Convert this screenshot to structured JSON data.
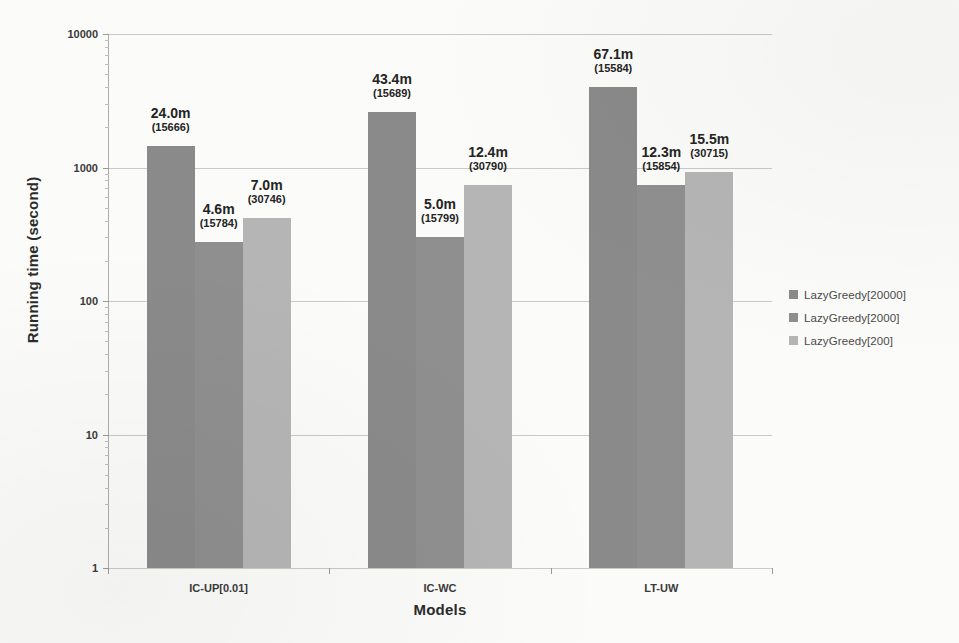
{
  "scan": {
    "clipped_top_text": "(cut off at top edge)"
  },
  "chart_data": {
    "type": "bar",
    "title": "",
    "xlabel": "Models",
    "ylabel": "Running time (second)",
    "yscale": "log",
    "ylim": [
      1,
      10000
    ],
    "ytick_labels": [
      "1",
      "10",
      "100",
      "1000",
      "10000"
    ],
    "ytick_values": [
      1,
      10,
      100,
      1000,
      10000
    ],
    "grid": true,
    "legend_position": "right",
    "categories": [
      "IC-UP[0.01]",
      "IC-WC",
      "LT-UW"
    ],
    "series": [
      {
        "name": "LazyGreedy[20000]",
        "color": "#8a8a8a",
        "values": [
          1440,
          2604,
          4026
        ],
        "labels": [
          "24.0m",
          "43.4m",
          "67.1m"
        ],
        "sublabels": [
          "(15666)",
          "(15689)",
          "(15584)"
        ]
      },
      {
        "name": "LazyGreedy[2000]",
        "color": "#8f8f8f",
        "values": [
          276,
          300,
          738
        ],
        "labels": [
          "4.6m",
          "5.0m",
          "12.3m"
        ],
        "sublabels": [
          "(15784)",
          "(15799)",
          "(15854)"
        ]
      },
      {
        "name": "LazyGreedy[200]",
        "color": "#b5b5b5",
        "values": [
          420,
          744,
          930
        ],
        "labels": [
          "7.0m",
          "12.4m",
          "15.5m"
        ],
        "sublabels": [
          "(30746)",
          "(30790)",
          "(30715)"
        ]
      }
    ]
  }
}
